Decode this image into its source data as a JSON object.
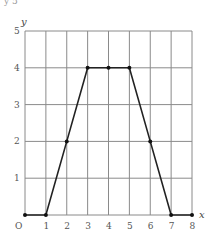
{
  "chart_data": {
    "type": "line",
    "title": "",
    "xlabel": "x",
    "ylabel": "y",
    "origin_label": "O",
    "x": [
      0,
      1,
      2,
      3,
      4,
      5,
      6,
      7,
      8
    ],
    "series": [
      {
        "name": "y",
        "values": [
          0,
          0,
          2,
          4,
          4,
          4,
          2,
          0,
          0
        ],
        "color": "#222222",
        "markers": true
      }
    ],
    "xlim": [
      0,
      8
    ],
    "ylim": [
      0,
      5
    ],
    "x_ticks": [
      "1",
      "2",
      "3",
      "4",
      "5",
      "6",
      "7",
      "8"
    ],
    "y_ticks": [
      "1",
      "2",
      "3",
      "4",
      "5"
    ],
    "grid": true,
    "legend": null
  },
  "header_fragment": "y 5"
}
